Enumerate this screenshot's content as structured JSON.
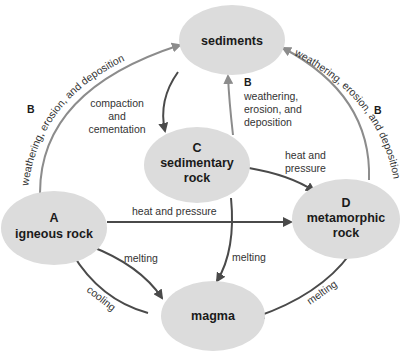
{
  "diagram": {
    "colors": {
      "node_fill": "#dcdcdc",
      "arrow_dark": "#4a4a4a",
      "arrow_light": "#8c8c8c",
      "text": "#1a1a1a"
    },
    "nodes": {
      "sediments": {
        "letter": "",
        "line1": "sediments",
        "line2": ""
      },
      "sedimentary": {
        "letter": "C",
        "line1": "sedimentary",
        "line2": "rock"
      },
      "igneous": {
        "letter": "A",
        "line1": "igneous rock",
        "line2": ""
      },
      "metamorphic": {
        "letter": "D",
        "line1": "metamorphic",
        "line2": "rock"
      },
      "magma": {
        "letter": "",
        "line1": "magma",
        "line2": ""
      }
    },
    "edges": {
      "igneous_to_sediments": {
        "letter": "B",
        "label": "weathering, erosion, and deposition"
      },
      "sediments_to_sedimentary": {
        "line1": "compaction",
        "line2": "and",
        "line3": "cementation"
      },
      "sedimentary_to_sediments": {
        "letter": "B",
        "line1": "weathering,",
        "line2": "erosion, and",
        "line3": "deposition"
      },
      "metamorphic_to_sediments": {
        "letter": "B",
        "label": "weathering, erosion, and deposition"
      },
      "sedimentary_to_metamorphic": {
        "line1": "heat and",
        "line2": "pressure"
      },
      "igneous_to_metamorphic": {
        "label": "heat and pressure"
      },
      "sedimentary_to_magma": {
        "label": "melting"
      },
      "igneous_to_magma": {
        "label": "melting"
      },
      "magma_to_igneous": {
        "label": "cooling"
      },
      "metamorphic_to_magma": {
        "label": "melting"
      }
    }
  }
}
